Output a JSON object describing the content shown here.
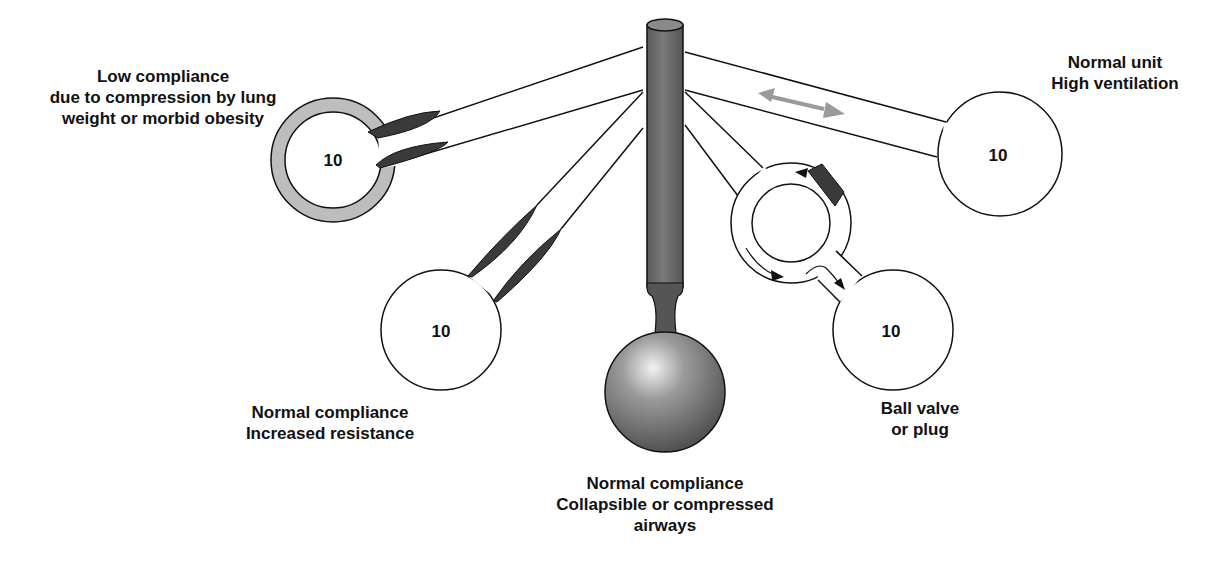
{
  "diagram": {
    "units": {
      "low_compliance": {
        "value": "10",
        "label_lines": [
          "Low compliance",
          "due to compression by lung",
          "weight or morbid obesity"
        ]
      },
      "increased_resistance": {
        "value": "10",
        "label_lines": [
          "Normal compliance",
          "Increased resistance"
        ]
      },
      "collapsible_airways": {
        "label_lines": [
          "Normal compliance",
          "Collapsible or compressed",
          "airways"
        ]
      },
      "ball_valve": {
        "value": "10",
        "label_lines": [
          "Ball valve",
          "or plug"
        ]
      },
      "high_ventilation": {
        "value": "10",
        "label_lines": [
          "Normal unit",
          "High ventilation"
        ]
      }
    },
    "colors": {
      "trachea": "#6e6e6e",
      "obstruction": "#3a3a3a",
      "stiff_wall": "#bdbdbd",
      "flow_arrow": "#9a9a9a",
      "outline": "#111111"
    },
    "icons": {
      "bidirectional_arrow": "double-arrow",
      "flow_arrows": "arrow"
    }
  }
}
